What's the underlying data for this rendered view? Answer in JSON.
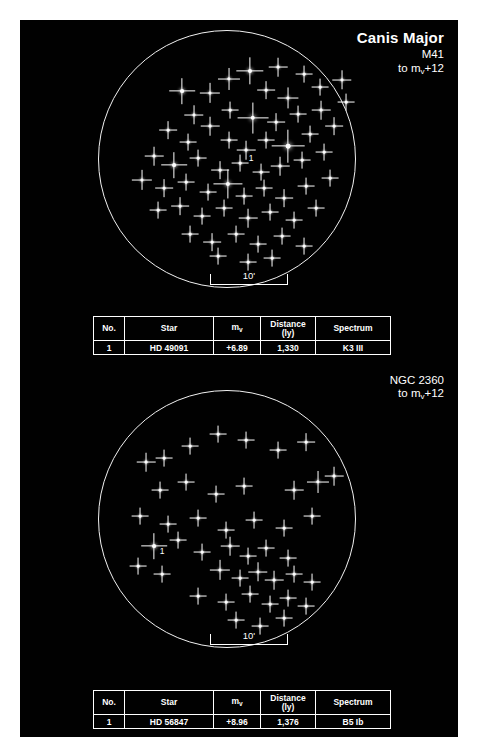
{
  "page": {
    "background": "#ffffff",
    "panel_color": "#010101",
    "star_color": "#ffffff",
    "line_color": "#f2f2f2"
  },
  "table_headers": {
    "no": "No.",
    "star": "Star",
    "mv": "m",
    "mv_sub": "v",
    "distance": "Distance",
    "distance_unit": "(ly)",
    "spectrum": "Spectrum"
  },
  "charts": [
    {
      "constellation": "Canis Major",
      "object": "M41",
      "limit_prefix": "to m",
      "limit_sub": "v",
      "limit_suffix": "+12",
      "scale_label": "10'",
      "label_marker": "1",
      "row": {
        "no": "1",
        "star": "HD 49091",
        "mv": "+6.89",
        "distance": "1,330",
        "spectrum": "K3 III"
      }
    },
    {
      "constellation": "",
      "object": "NGC 2360",
      "limit_prefix": "to m",
      "limit_sub": "v",
      "limit_suffix": "+12",
      "scale_label": "10'",
      "label_marker": "1",
      "row": {
        "no": "1",
        "star": "HD 56847",
        "mv": "+8.96",
        "distance": "1,376",
        "spectrum": "B5 Ib"
      }
    }
  ],
  "chart_data": {
    "type": "scatter",
    "xlabel": "",
    "ylabel": "",
    "grid": false,
    "legend": "none",
    "panels": [
      {
        "name": "M41",
        "constellation": "Canis Major",
        "limiting_magnitude": 12,
        "field_scale_arcmin": 10,
        "field_radius_px": 129,
        "stars": [
          {
            "x": 131,
            "y": 49,
            "mag": 1.6
          },
          {
            "x": 152,
            "y": 41,
            "mag": 2.2
          },
          {
            "x": 112,
            "y": 63,
            "mag": 1.4
          },
          {
            "x": 180,
            "y": 37,
            "mag": 1.2
          },
          {
            "x": 206,
            "y": 44,
            "mag": 1.0
          },
          {
            "x": 96,
            "y": 85,
            "mag": 1.3
          },
          {
            "x": 84,
            "y": 61,
            "mag": 2.0
          },
          {
            "x": 168,
            "y": 60,
            "mag": 1.1
          },
          {
            "x": 190,
            "y": 68,
            "mag": 1.5
          },
          {
            "x": 222,
            "y": 57,
            "mag": 1.0
          },
          {
            "x": 244,
            "y": 50,
            "mag": 1.3
          },
          {
            "x": 132,
            "y": 80,
            "mag": 1.0
          },
          {
            "x": 112,
            "y": 96,
            "mag": 1.2
          },
          {
            "x": 155,
            "y": 88,
            "mag": 2.6
          },
          {
            "x": 178,
            "y": 92,
            "mag": 1.1
          },
          {
            "x": 200,
            "y": 84,
            "mag": 1.0
          },
          {
            "x": 223,
            "y": 80,
            "mag": 1.2
          },
          {
            "x": 248,
            "y": 72,
            "mag": 1.0
          },
          {
            "x": 70,
            "y": 100,
            "mag": 1.1
          },
          {
            "x": 90,
            "y": 112,
            "mag": 1.0
          },
          {
            "x": 131,
            "y": 110,
            "mag": 1.0
          },
          {
            "x": 148,
            "y": 120,
            "mag": 1.2
          },
          {
            "x": 168,
            "y": 110,
            "mag": 1.0
          },
          {
            "x": 190,
            "y": 116,
            "mag": 2.8
          },
          {
            "x": 212,
            "y": 104,
            "mag": 1.0
          },
          {
            "x": 236,
            "y": 96,
            "mag": 1.1
          },
          {
            "x": 56,
            "y": 126,
            "mag": 1.2
          },
          {
            "x": 76,
            "y": 135,
            "mag": 2.0
          },
          {
            "x": 100,
            "y": 128,
            "mag": 1.0
          },
          {
            "x": 122,
            "y": 140,
            "mag": 1.1
          },
          {
            "x": 142,
            "y": 133,
            "mag": 1.0
          },
          {
            "x": 163,
            "y": 142,
            "mag": 1.0
          },
          {
            "x": 182,
            "y": 136,
            "mag": 1.2
          },
          {
            "x": 204,
            "y": 130,
            "mag": 1.0
          },
          {
            "x": 226,
            "y": 122,
            "mag": 1.0
          },
          {
            "x": 44,
            "y": 150,
            "mag": 1.4
          },
          {
            "x": 66,
            "y": 158,
            "mag": 1.1
          },
          {
            "x": 88,
            "y": 152,
            "mag": 1.0
          },
          {
            "x": 110,
            "y": 162,
            "mag": 1.0
          },
          {
            "x": 130,
            "y": 154,
            "mag": 2.4
          },
          {
            "x": 146,
            "y": 166,
            "mag": 1.0
          },
          {
            "x": 166,
            "y": 158,
            "mag": 1.0
          },
          {
            "x": 186,
            "y": 168,
            "mag": 1.1
          },
          {
            "x": 208,
            "y": 156,
            "mag": 1.0
          },
          {
            "x": 232,
            "y": 148,
            "mag": 1.0
          },
          {
            "x": 60,
            "y": 180,
            "mag": 1.0
          },
          {
            "x": 82,
            "y": 176,
            "mag": 1.1
          },
          {
            "x": 104,
            "y": 186,
            "mag": 1.0
          },
          {
            "x": 126,
            "y": 178,
            "mag": 1.0
          },
          {
            "x": 150,
            "y": 188,
            "mag": 1.2
          },
          {
            "x": 172,
            "y": 182,
            "mag": 1.0
          },
          {
            "x": 196,
            "y": 190,
            "mag": 1.0
          },
          {
            "x": 218,
            "y": 178,
            "mag": 1.0
          },
          {
            "x": 92,
            "y": 204,
            "mag": 1.0
          },
          {
            "x": 114,
            "y": 212,
            "mag": 1.1
          },
          {
            "x": 138,
            "y": 204,
            "mag": 1.0
          },
          {
            "x": 160,
            "y": 214,
            "mag": 1.0
          },
          {
            "x": 184,
            "y": 206,
            "mag": 1.0
          },
          {
            "x": 206,
            "y": 216,
            "mag": 1.0
          },
          {
            "x": 150,
            "y": 232,
            "mag": 1.0
          },
          {
            "x": 174,
            "y": 228,
            "mag": 1.0
          },
          {
            "x": 120,
            "y": 226,
            "mag": 1.0
          }
        ],
        "labeled_star": {
          "x": 146,
          "y": 124,
          "label": "1"
        }
      },
      {
        "name": "NGC 2360",
        "constellation": "Canis Major",
        "limiting_magnitude": 12,
        "field_scale_arcmin": 10,
        "field_radius_px": 129,
        "stars": [
          {
            "x": 48,
            "y": 72,
            "mag": 1.2
          },
          {
            "x": 66,
            "y": 68,
            "mag": 1.0
          },
          {
            "x": 92,
            "y": 56,
            "mag": 1.0
          },
          {
            "x": 120,
            "y": 44,
            "mag": 1.0
          },
          {
            "x": 148,
            "y": 50,
            "mag": 1.0
          },
          {
            "x": 180,
            "y": 60,
            "mag": 1.0
          },
          {
            "x": 208,
            "y": 52,
            "mag": 1.1
          },
          {
            "x": 62,
            "y": 100,
            "mag": 1.0
          },
          {
            "x": 88,
            "y": 92,
            "mag": 1.0
          },
          {
            "x": 118,
            "y": 104,
            "mag": 1.0
          },
          {
            "x": 146,
            "y": 96,
            "mag": 1.0
          },
          {
            "x": 196,
            "y": 100,
            "mag": 1.2
          },
          {
            "x": 220,
            "y": 92,
            "mag": 1.6
          },
          {
            "x": 236,
            "y": 86,
            "mag": 1.2
          },
          {
            "x": 42,
            "y": 126,
            "mag": 1.0
          },
          {
            "x": 70,
            "y": 134,
            "mag": 1.0
          },
          {
            "x": 100,
            "y": 128,
            "mag": 1.0
          },
          {
            "x": 128,
            "y": 140,
            "mag": 1.0
          },
          {
            "x": 156,
            "y": 130,
            "mag": 1.0
          },
          {
            "x": 186,
            "y": 138,
            "mag": 1.0
          },
          {
            "x": 214,
            "y": 126,
            "mag": 1.0
          },
          {
            "x": 56,
            "y": 156,
            "mag": 2.0
          },
          {
            "x": 80,
            "y": 150,
            "mag": 1.0
          },
          {
            "x": 104,
            "y": 162,
            "mag": 1.0
          },
          {
            "x": 132,
            "y": 156,
            "mag": 1.2
          },
          {
            "x": 150,
            "y": 166,
            "mag": 1.0
          },
          {
            "x": 168,
            "y": 158,
            "mag": 1.0
          },
          {
            "x": 190,
            "y": 168,
            "mag": 1.0
          },
          {
            "x": 40,
            "y": 176,
            "mag": 1.0
          },
          {
            "x": 64,
            "y": 184,
            "mag": 1.0
          },
          {
            "x": 122,
            "y": 180,
            "mag": 1.4
          },
          {
            "x": 142,
            "y": 188,
            "mag": 1.0
          },
          {
            "x": 160,
            "y": 182,
            "mag": 1.3
          },
          {
            "x": 176,
            "y": 190,
            "mag": 1.2
          },
          {
            "x": 196,
            "y": 184,
            "mag": 1.0
          },
          {
            "x": 214,
            "y": 192,
            "mag": 1.0
          },
          {
            "x": 100,
            "y": 206,
            "mag": 1.0
          },
          {
            "x": 128,
            "y": 212,
            "mag": 1.0
          },
          {
            "x": 152,
            "y": 204,
            "mag": 1.0
          },
          {
            "x": 172,
            "y": 214,
            "mag": 1.0
          },
          {
            "x": 190,
            "y": 208,
            "mag": 1.0
          },
          {
            "x": 208,
            "y": 216,
            "mag": 1.0
          },
          {
            "x": 138,
            "y": 230,
            "mag": 1.0
          },
          {
            "x": 162,
            "y": 236,
            "mag": 1.0
          },
          {
            "x": 186,
            "y": 228,
            "mag": 1.0
          }
        ],
        "labeled_star": {
          "x": 57,
          "y": 157,
          "label": "1"
        }
      }
    ]
  }
}
